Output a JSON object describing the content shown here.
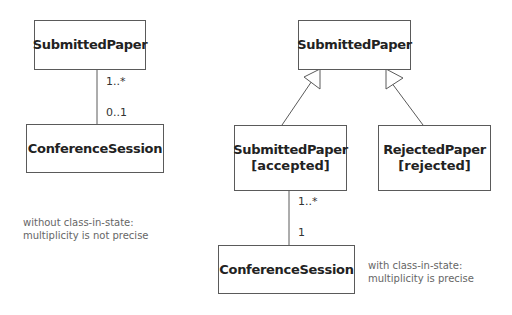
{
  "left": {
    "class_top": "SubmittedPaper",
    "class_bottom": "ConferenceSession",
    "mult_top": "1..*",
    "mult_bottom": "0..1",
    "note_line1": "without class-in-state:",
    "note_line2": "multiplicity is not precise"
  },
  "right": {
    "class_parent": "SubmittedPaper",
    "class_accepted": "SubmittedPaper",
    "state_accepted": "[accepted]",
    "class_rejected": "RejectedPaper",
    "state_rejected": "[rejected]",
    "class_bottom": "ConferenceSession",
    "mult_top": "1..*",
    "mult_bottom": "1",
    "note_line1": "with class-in-state:",
    "note_line2": "multiplicity is precise"
  },
  "colors": {
    "line": "#5a5a5a",
    "text": "#222222",
    "note": "#666666"
  }
}
